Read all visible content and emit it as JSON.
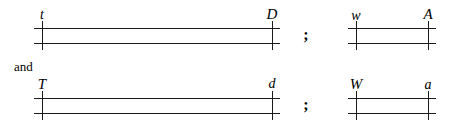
{
  "figure": {
    "background_color": "#ffffff",
    "ink_color": "#1a1a1a",
    "conjunction": "and",
    "separator": ";"
  },
  "rows": [
    {
      "name": "top-row",
      "conjunction_before": "",
      "groups": [
        {
          "name": "long-track-top",
          "kind": "long",
          "left_label": "t",
          "right_label": "D",
          "left_x": 42,
          "right_x": 272,
          "rail_top_y": 28,
          "rail_bottom_y": 43,
          "label_y": 8
        },
        {
          "name": "short-track-top",
          "kind": "short",
          "left_label": "w",
          "right_label": "A",
          "left_x": 356,
          "right_x": 428,
          "rail_top_y": 28,
          "rail_bottom_y": 43,
          "label_y": 8
        }
      ],
      "separator_x": 306,
      "separator_y": 27
    },
    {
      "name": "bottom-row",
      "conjunction_before": "and",
      "groups": [
        {
          "name": "long-track-bottom",
          "kind": "long",
          "left_label": "T",
          "right_label": "d",
          "left_x": 42,
          "right_x": 272,
          "rail_top_y": 98,
          "rail_bottom_y": 113,
          "label_y": 78
        },
        {
          "name": "short-track-bottom",
          "kind": "short",
          "left_label": "W",
          "right_label": "a",
          "left_x": 356,
          "right_x": 428,
          "rail_top_y": 98,
          "rail_bottom_y": 113,
          "label_y": 78
        }
      ],
      "separator_x": 306,
      "separator_y": 97
    }
  ],
  "conjunction_position": {
    "x": 14,
    "y": 60
  },
  "tick_overhang": 7,
  "rail_overhang": 8
}
